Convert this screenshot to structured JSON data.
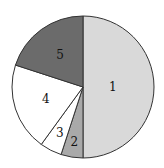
{
  "chart_data": {
    "type": "pie",
    "title": "",
    "categories": [
      "1",
      "2",
      "3",
      "4",
      "5"
    ],
    "values": [
      50,
      5,
      5,
      20,
      20
    ],
    "start_angle": "12 o'clock",
    "direction": "clockwise",
    "colors": [
      "#d9d9d9",
      "#a9a9a9",
      "#ffffff",
      "#ffffff",
      "#6b6b6b"
    ],
    "labels_inside": true,
    "legend": "none"
  },
  "slices": [
    {
      "label": "1",
      "value": 50,
      "color": "#d9d9d9"
    },
    {
      "label": "2",
      "value": 5,
      "color": "#a9a9a9"
    },
    {
      "label": "3",
      "value": 5,
      "color": "#ffffff"
    },
    {
      "label": "4",
      "value": 20,
      "color": "#ffffff"
    },
    {
      "label": "5",
      "value": 20,
      "color": "#6b6b6b"
    }
  ]
}
